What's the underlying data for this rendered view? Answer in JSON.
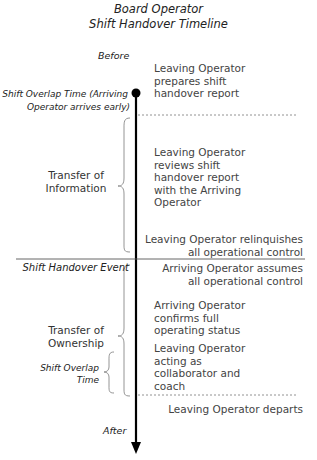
{
  "title": {
    "line1": "Board Operator",
    "line2": "Shift Handover Timeline"
  },
  "timeline": {
    "start_label": "Before",
    "end_label": "After",
    "overlap_start_label_line1": "Shift Overlap Time (Arriving",
    "overlap_start_label_line2": "Operator arrives early)",
    "handover_event_label": "Shift Handover Event"
  },
  "phases": [
    {
      "label_line1": "Transfer of",
      "label_line2": "Information"
    },
    {
      "label_line1": "Transfer of",
      "label_line2": "Ownership"
    }
  ],
  "sub_phase": {
    "label_line1": "Shift Overlap",
    "label_line2": "Time"
  },
  "events": [
    {
      "lines": [
        "Leaving Operator",
        "prepares shift",
        "handover report"
      ]
    },
    {
      "lines": [
        "Leaving Operator",
        "reviews shift",
        "handover report",
        "with the Arriving",
        "Operator"
      ]
    },
    {
      "lines": [
        "Leaving Operator relinquishes",
        "all operational control"
      ]
    },
    {
      "lines": [
        "Arriving Operator assumes",
        "all operational control"
      ]
    },
    {
      "lines": [
        "Arriving Operator",
        "confirms full",
        "operating status"
      ]
    },
    {
      "lines": [
        "Leaving Operator",
        "acting as",
        "collaborator and",
        "coach"
      ]
    },
    {
      "lines": [
        "Leaving Operator departs"
      ]
    }
  ]
}
